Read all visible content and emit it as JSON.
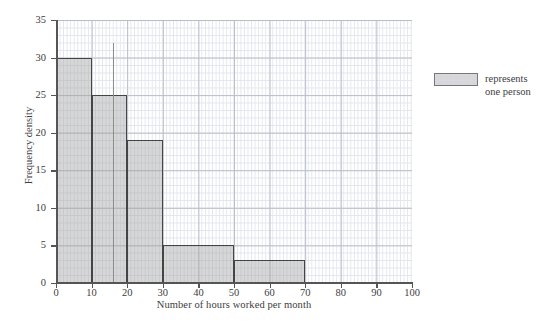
{
  "chart_data": {
    "type": "bar",
    "title": "",
    "subtitle": "",
    "xlabel": "Number of hours worked per month",
    "ylabel": "Frequency density",
    "xlim": [
      0,
      100
    ],
    "ylim": [
      0,
      35
    ],
    "xticks": [
      0,
      10,
      20,
      30,
      40,
      50,
      60,
      70,
      80,
      90,
      100
    ],
    "yticks": [
      0,
      5,
      10,
      15,
      20,
      25,
      30,
      35
    ],
    "grid": "major and minor gridlines on both axes",
    "grid_minor_x_step": 1,
    "grid_minor_y_step": 1,
    "grid_major_x_step": 10,
    "grid_major_y_step": 5,
    "legend_position": "right",
    "bins": [
      {
        "label": "0-10",
        "start": 0,
        "end": 10,
        "frequency_density": 30,
        "frequency": 300
      },
      {
        "label": "10-20",
        "start": 10,
        "end": 20,
        "frequency_density": 25,
        "frequency": 250
      },
      {
        "label": "20-30",
        "start": 20,
        "end": 30,
        "frequency_density": 19,
        "frequency": 190
      },
      {
        "label": "30-50",
        "start": 30,
        "end": 50,
        "frequency_density": 5,
        "frequency": 100
      },
      {
        "label": "50-70",
        "start": 50,
        "end": 70,
        "frequency_density": 3,
        "frequency": 60
      }
    ],
    "annotations": [
      {
        "name": "stray-vertical-line",
        "x": 16,
        "y_top": 32,
        "y_bottom": 25
      }
    ],
    "colors": {
      "bar_fill": "#a0a0a0",
      "bar_edge": "#444444",
      "grid_major": "#b9bdc9",
      "grid_minor": "#e3e6ee",
      "axis": "#555555",
      "text": "#3d3d3d",
      "background": "#ffffff"
    }
  },
  "legend": {
    "swatch_name": "bar-swatch",
    "line1": "represents",
    "line2": "one person"
  }
}
